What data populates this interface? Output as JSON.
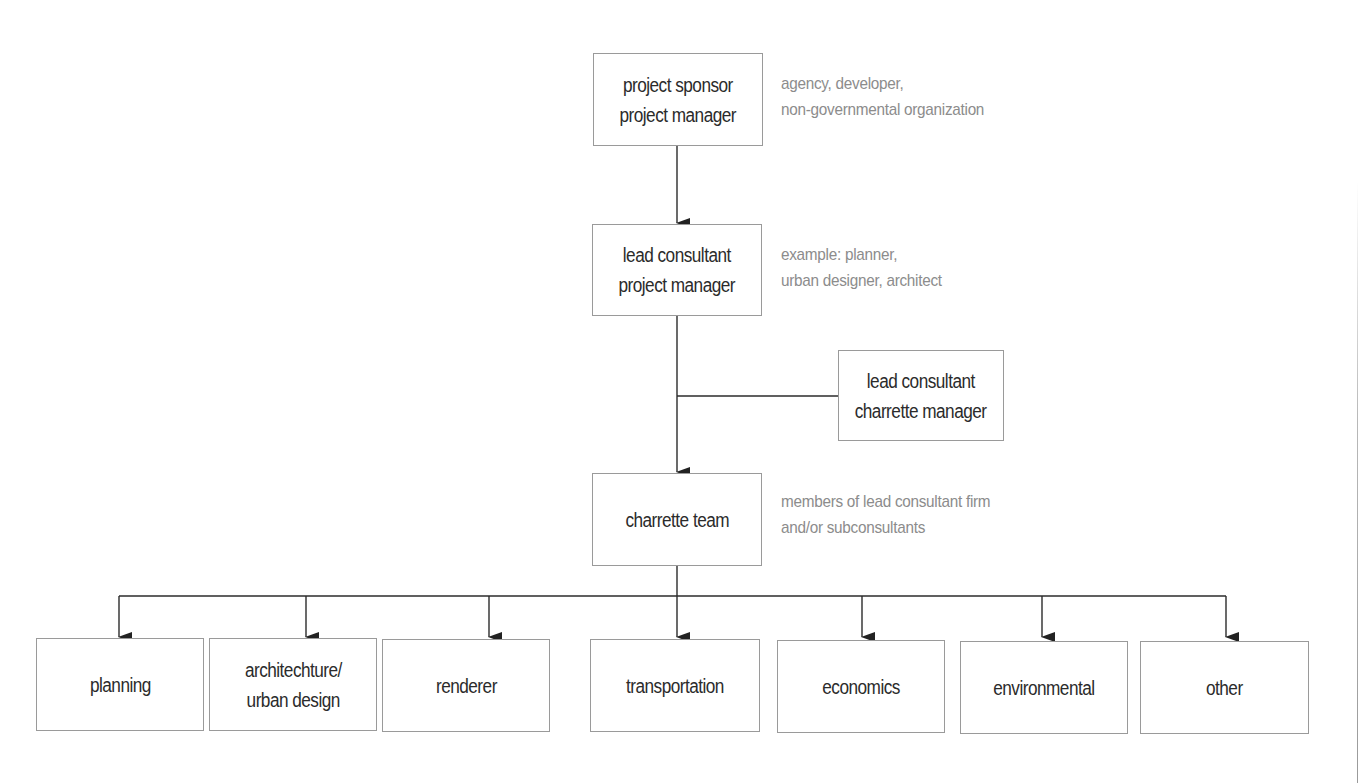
{
  "diagram": {
    "type": "org-chart",
    "colors": {
      "box_border": "#9a9a9a",
      "box_text": "#2b2b2b",
      "note_text": "#8c8c8c",
      "connector": "#2b2b2b"
    },
    "top": {
      "lines": [
        "project sponsor",
        "project manager"
      ],
      "note": [
        "agency, developer,",
        "non-governmental organization"
      ]
    },
    "lead": {
      "lines": [
        "lead consultant",
        "project manager"
      ],
      "note": [
        "example: planner,",
        "urban designer, architect"
      ]
    },
    "side": {
      "lines": [
        "lead consultant",
        "charrette manager"
      ]
    },
    "team": {
      "lines": [
        "charrette team"
      ],
      "note": [
        "members of lead consultant firm",
        "and/or subconsultants"
      ]
    },
    "disciplines": [
      {
        "lines": [
          "planning"
        ]
      },
      {
        "lines": [
          "architechture/",
          "urban design"
        ]
      },
      {
        "lines": [
          "renderer"
        ]
      },
      {
        "lines": [
          "transportation"
        ]
      },
      {
        "lines": [
          "economics"
        ]
      },
      {
        "lines": [
          "environmental"
        ]
      },
      {
        "lines": [
          "other"
        ]
      }
    ]
  }
}
